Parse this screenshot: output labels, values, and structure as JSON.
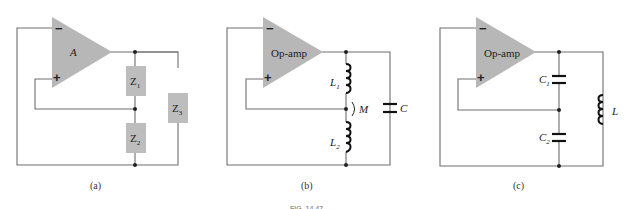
{
  "figure": {
    "caption_partial": "FIG. 14.47",
    "panels": [
      {
        "id": "a",
        "caption": "(a)",
        "amplifier_label": "A",
        "inverting_input": "−",
        "noninverting_input": "+",
        "components": [
          {
            "name": "Z",
            "sub": "1",
            "type": "impedance"
          },
          {
            "name": "Z",
            "sub": "2",
            "type": "impedance"
          },
          {
            "name": "Z",
            "sub": "3",
            "type": "impedance"
          }
        ]
      },
      {
        "id": "b",
        "caption": "(b)",
        "amplifier_label": "Op-amp",
        "inverting_input": "−",
        "noninverting_input": "+",
        "components": [
          {
            "name": "L",
            "sub": "1",
            "type": "inductor"
          },
          {
            "name": "L",
            "sub": "2",
            "type": "inductor"
          },
          {
            "name": "M",
            "sub": "",
            "type": "mutual-inductance"
          },
          {
            "name": "C",
            "sub": "",
            "type": "capacitor"
          }
        ]
      },
      {
        "id": "c",
        "caption": "(c)",
        "amplifier_label": "Op-amp",
        "inverting_input": "−",
        "noninverting_input": "+",
        "components": [
          {
            "name": "C",
            "sub": "1",
            "type": "capacitor"
          },
          {
            "name": "C",
            "sub": "2",
            "type": "capacitor"
          },
          {
            "name": "L",
            "sub": "",
            "type": "inductor"
          }
        ]
      }
    ]
  }
}
